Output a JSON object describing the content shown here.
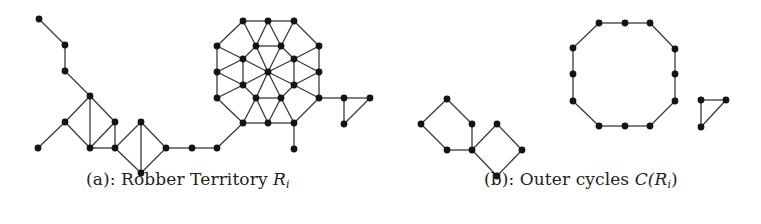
{
  "figure": {
    "panel_a": {
      "caption_prefix": "(a): Robber Territory ",
      "caption_math": "R",
      "caption_sub": "i",
      "nodes": [
        [
          39,
          19
        ],
        [
          65,
          45
        ],
        [
          65,
          71
        ],
        [
          90,
          96
        ],
        [
          65,
          122
        ],
        [
          38,
          148
        ],
        [
          90,
          148
        ],
        [
          115,
          122
        ],
        [
          115,
          148
        ],
        [
          141,
          122
        ],
        [
          141,
          173
        ],
        [
          166,
          148
        ],
        [
          192,
          148
        ],
        [
          217,
          148
        ],
        [
          243,
          21
        ],
        [
          268,
          21
        ],
        [
          294,
          21
        ],
        [
          319,
          46
        ],
        [
          319,
          72
        ],
        [
          319,
          98
        ],
        [
          294,
          123
        ],
        [
          268,
          123
        ],
        [
          243,
          123
        ],
        [
          217,
          98
        ],
        [
          217,
          72
        ],
        [
          217,
          46
        ],
        [
          256,
          46
        ],
        [
          281,
          46
        ],
        [
          294,
          59
        ],
        [
          294,
          85
        ],
        [
          281,
          98
        ],
        [
          256,
          98
        ],
        [
          243,
          85
        ],
        [
          243,
          59
        ],
        [
          268,
          72
        ],
        [
          294,
          149
        ],
        [
          344,
          98
        ],
        [
          370,
          98
        ],
        [
          344,
          124
        ]
      ],
      "edges": [
        [
          [
            39,
            19
          ],
          [
            65,
            45
          ]
        ],
        [
          [
            65,
            45
          ],
          [
            65,
            71
          ]
        ],
        [
          [
            65,
            71
          ],
          [
            90,
            96
          ]
        ],
        [
          [
            90,
            96
          ],
          [
            65,
            122
          ]
        ],
        [
          [
            65,
            122
          ],
          [
            38,
            148
          ]
        ],
        [
          [
            65,
            122
          ],
          [
            90,
            148
          ]
        ],
        [
          [
            90,
            96
          ],
          [
            90,
            148
          ]
        ],
        [
          [
            90,
            96
          ],
          [
            115,
            122
          ]
        ],
        [
          [
            115,
            122
          ],
          [
            90,
            148
          ]
        ],
        [
          [
            115,
            122
          ],
          [
            115,
            148
          ]
        ],
        [
          [
            90,
            148
          ],
          [
            115,
            148
          ]
        ],
        [
          [
            115,
            148
          ],
          [
            141,
            122
          ]
        ],
        [
          [
            115,
            148
          ],
          [
            141,
            173
          ]
        ],
        [
          [
            141,
            122
          ],
          [
            141,
            173
          ]
        ],
        [
          [
            141,
            122
          ],
          [
            166,
            148
          ]
        ],
        [
          [
            141,
            173
          ],
          [
            166,
            148
          ]
        ],
        [
          [
            166,
            148
          ],
          [
            192,
            148
          ]
        ],
        [
          [
            192,
            148
          ],
          [
            217,
            148
          ]
        ],
        [
          [
            217,
            148
          ],
          [
            243,
            123
          ]
        ],
        [
          [
            243,
            21
          ],
          [
            268,
            21
          ]
        ],
        [
          [
            268,
            21
          ],
          [
            294,
            21
          ]
        ],
        [
          [
            294,
            21
          ],
          [
            319,
            46
          ]
        ],
        [
          [
            319,
            46
          ],
          [
            319,
            72
          ]
        ],
        [
          [
            319,
            72
          ],
          [
            319,
            98
          ]
        ],
        [
          [
            319,
            98
          ],
          [
            294,
            123
          ]
        ],
        [
          [
            294,
            123
          ],
          [
            268,
            123
          ]
        ],
        [
          [
            268,
            123
          ],
          [
            243,
            123
          ]
        ],
        [
          [
            243,
            123
          ],
          [
            217,
            98
          ]
        ],
        [
          [
            217,
            98
          ],
          [
            217,
            72
          ]
        ],
        [
          [
            217,
            72
          ],
          [
            217,
            46
          ]
        ],
        [
          [
            217,
            46
          ],
          [
            243,
            21
          ]
        ],
        [
          [
            256,
            46
          ],
          [
            281,
            46
          ]
        ],
        [
          [
            281,
            46
          ],
          [
            294,
            59
          ]
        ],
        [
          [
            294,
            59
          ],
          [
            294,
            85
          ]
        ],
        [
          [
            294,
            85
          ],
          [
            281,
            98
          ]
        ],
        [
          [
            281,
            98
          ],
          [
            256,
            98
          ]
        ],
        [
          [
            256,
            98
          ],
          [
            243,
            85
          ]
        ],
        [
          [
            243,
            85
          ],
          [
            243,
            59
          ]
        ],
        [
          [
            243,
            59
          ],
          [
            256,
            46
          ]
        ],
        [
          [
            268,
            72
          ],
          [
            256,
            46
          ]
        ],
        [
          [
            268,
            72
          ],
          [
            281,
            46
          ]
        ],
        [
          [
            268,
            72
          ],
          [
            294,
            59
          ]
        ],
        [
          [
            268,
            72
          ],
          [
            294,
            85
          ]
        ],
        [
          [
            268,
            72
          ],
          [
            281,
            98
          ]
        ],
        [
          [
            268,
            72
          ],
          [
            256,
            98
          ]
        ],
        [
          [
            268,
            72
          ],
          [
            243,
            85
          ]
        ],
        [
          [
            268,
            72
          ],
          [
            243,
            59
          ]
        ],
        [
          [
            243,
            21
          ],
          [
            256,
            46
          ]
        ],
        [
          [
            268,
            21
          ],
          [
            256,
            46
          ]
        ],
        [
          [
            268,
            21
          ],
          [
            281,
            46
          ]
        ],
        [
          [
            294,
            21
          ],
          [
            281,
            46
          ]
        ],
        [
          [
            319,
            46
          ],
          [
            294,
            59
          ]
        ],
        [
          [
            319,
            72
          ],
          [
            294,
            59
          ]
        ],
        [
          [
            319,
            72
          ],
          [
            294,
            85
          ]
        ],
        [
          [
            319,
            98
          ],
          [
            294,
            85
          ]
        ],
        [
          [
            294,
            123
          ],
          [
            281,
            98
          ]
        ],
        [
          [
            268,
            123
          ],
          [
            281,
            98
          ]
        ],
        [
          [
            268,
            123
          ],
          [
            256,
            98
          ]
        ],
        [
          [
            243,
            123
          ],
          [
            256,
            98
          ]
        ],
        [
          [
            217,
            98
          ],
          [
            243,
            85
          ]
        ],
        [
          [
            217,
            72
          ],
          [
            243,
            85
          ]
        ],
        [
          [
            217,
            72
          ],
          [
            243,
            59
          ]
        ],
        [
          [
            217,
            46
          ],
          [
            243,
            59
          ]
        ],
        [
          [
            294,
            123
          ],
          [
            294,
            149
          ]
        ],
        [
          [
            319,
            98
          ],
          [
            344,
            98
          ]
        ],
        [
          [
            344,
            98
          ],
          [
            370,
            98
          ]
        ],
        [
          [
            344,
            98
          ],
          [
            344,
            124
          ]
        ],
        [
          [
            344,
            124
          ],
          [
            370,
            98
          ]
        ]
      ]
    },
    "panel_b": {
      "caption_prefix": "(b): Outer cycles ",
      "caption_math": "C(R",
      "caption_sub": "i",
      "caption_suffix": ")",
      "nodes": [
        [
          447,
          99
        ],
        [
          421,
          124
        ],
        [
          447,
          150
        ],
        [
          472,
          124
        ],
        [
          472,
          150
        ],
        [
          497,
          124
        ],
        [
          522,
          150
        ],
        [
          497,
          176
        ],
        [
          599,
          23
        ],
        [
          625,
          23
        ],
        [
          650,
          23
        ],
        [
          675,
          49
        ],
        [
          675,
          74
        ],
        [
          675,
          101
        ],
        [
          650,
          126
        ],
        [
          625,
          126
        ],
        [
          599,
          126
        ],
        [
          573,
          101
        ],
        [
          573,
          74
        ],
        [
          573,
          48
        ],
        [
          701,
          100
        ],
        [
          726,
          100
        ],
        [
          701,
          127
        ]
      ],
      "edges": [
        [
          [
            447,
            99
          ],
          [
            421,
            124
          ]
        ],
        [
          [
            421,
            124
          ],
          [
            447,
            150
          ]
        ],
        [
          [
            447,
            150
          ],
          [
            472,
            150
          ]
        ],
        [
          [
            472,
            150
          ],
          [
            472,
            124
          ]
        ],
        [
          [
            472,
            124
          ],
          [
            447,
            99
          ]
        ],
        [
          [
            472,
            150
          ],
          [
            497,
            124
          ]
        ],
        [
          [
            497,
            124
          ],
          [
            522,
            150
          ]
        ],
        [
          [
            522,
            150
          ],
          [
            497,
            176
          ]
        ],
        [
          [
            497,
            176
          ],
          [
            472,
            150
          ]
        ],
        [
          [
            599,
            23
          ],
          [
            625,
            23
          ]
        ],
        [
          [
            625,
            23
          ],
          [
            650,
            23
          ]
        ],
        [
          [
            650,
            23
          ],
          [
            675,
            49
          ]
        ],
        [
          [
            675,
            49
          ],
          [
            675,
            74
          ]
        ],
        [
          [
            675,
            74
          ],
          [
            675,
            101
          ]
        ],
        [
          [
            675,
            101
          ],
          [
            650,
            126
          ]
        ],
        [
          [
            650,
            126
          ],
          [
            625,
            126
          ]
        ],
        [
          [
            625,
            126
          ],
          [
            599,
            126
          ]
        ],
        [
          [
            599,
            126
          ],
          [
            573,
            101
          ]
        ],
        [
          [
            573,
            101
          ],
          [
            573,
            74
          ]
        ],
        [
          [
            573,
            74
          ],
          [
            573,
            48
          ]
        ],
        [
          [
            573,
            48
          ],
          [
            599,
            23
          ]
        ],
        [
          [
            701,
            100
          ],
          [
            726,
            100
          ]
        ],
        [
          [
            726,
            100
          ],
          [
            701,
            127
          ]
        ],
        [
          [
            701,
            127
          ],
          [
            701,
            100
          ]
        ]
      ]
    },
    "style": {
      "node_color": "#141414",
      "edge_color": "#3a3a3a",
      "node_radius": 3.4
    }
  }
}
